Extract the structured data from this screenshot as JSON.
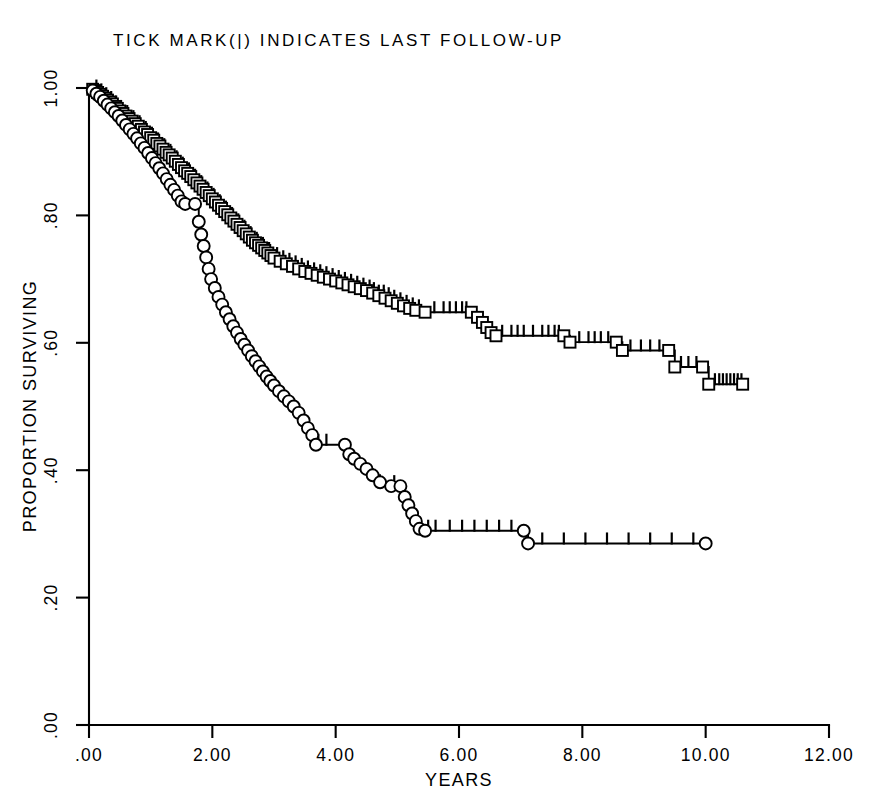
{
  "chart_data": {
    "type": "line",
    "subtype": "kaplan-meier-survival",
    "title": "TICK MARK(|) INDICATES LAST FOLLOW-UP",
    "xlabel": "YEARS",
    "ylabel": "PROPORTION SURVIVING",
    "xlim": [
      0,
      12
    ],
    "ylim": [
      0,
      1
    ],
    "grid": false,
    "legend": "none",
    "x_ticks": [
      0,
      2,
      4,
      6,
      8,
      10,
      12
    ],
    "x_tick_labels": [
      ".00",
      "2.00",
      "4.00",
      "6.00",
      "8.00",
      "10.00",
      "12.00"
    ],
    "y_ticks": [
      0,
      0.2,
      0.4,
      0.6,
      0.8,
      1.0
    ],
    "y_tick_labels": [
      ".00",
      ".20",
      ".40",
      ".60",
      ".80",
      "1.00"
    ],
    "annotation": "Tick marks on the step curves denote censored observations (last follow-up).",
    "series": [
      {
        "name": "upper-curve",
        "marker": "open-square",
        "marker_count_note": "markers plotted at every event (death) step",
        "x_end": 10.6,
        "y_end": 0.535,
        "points": [
          [
            0.0,
            1.0
          ],
          [
            0.06,
            0.998
          ],
          [
            0.1,
            0.996
          ],
          [
            0.14,
            0.993
          ],
          [
            0.18,
            0.99
          ],
          [
            0.22,
            0.987
          ],
          [
            0.26,
            0.984
          ],
          [
            0.3,
            0.981
          ],
          [
            0.34,
            0.978
          ],
          [
            0.38,
            0.975
          ],
          [
            0.42,
            0.971
          ],
          [
            0.46,
            0.968
          ],
          [
            0.5,
            0.964
          ],
          [
            0.55,
            0.96
          ],
          [
            0.6,
            0.956
          ],
          [
            0.65,
            0.952
          ],
          [
            0.7,
            0.948
          ],
          [
            0.75,
            0.944
          ],
          [
            0.8,
            0.94
          ],
          [
            0.85,
            0.935
          ],
          [
            0.9,
            0.931
          ],
          [
            0.95,
            0.927
          ],
          [
            1.0,
            0.922
          ],
          [
            1.05,
            0.918
          ],
          [
            1.1,
            0.913
          ],
          [
            1.15,
            0.909
          ],
          [
            1.2,
            0.904
          ],
          [
            1.25,
            0.899
          ],
          [
            1.3,
            0.895
          ],
          [
            1.35,
            0.89
          ],
          [
            1.4,
            0.885
          ],
          [
            1.45,
            0.88
          ],
          [
            1.5,
            0.875
          ],
          [
            1.55,
            0.87
          ],
          [
            1.6,
            0.866
          ],
          [
            1.65,
            0.861
          ],
          [
            1.7,
            0.856
          ],
          [
            1.75,
            0.851
          ],
          [
            1.8,
            0.846
          ],
          [
            1.85,
            0.841
          ],
          [
            1.9,
            0.836
          ],
          [
            1.95,
            0.831
          ],
          [
            2.0,
            0.826
          ],
          [
            2.05,
            0.821
          ],
          [
            2.1,
            0.816
          ],
          [
            2.15,
            0.811
          ],
          [
            2.2,
            0.806
          ],
          [
            2.25,
            0.801
          ],
          [
            2.3,
            0.796
          ],
          [
            2.35,
            0.791
          ],
          [
            2.4,
            0.786
          ],
          [
            2.45,
            0.781
          ],
          [
            2.5,
            0.776
          ],
          [
            2.55,
            0.771
          ],
          [
            2.6,
            0.766
          ],
          [
            2.65,
            0.761
          ],
          [
            2.7,
            0.757
          ],
          [
            2.75,
            0.753
          ],
          [
            2.8,
            0.749
          ],
          [
            2.85,
            0.745
          ],
          [
            2.9,
            0.741
          ],
          [
            2.95,
            0.737
          ],
          [
            3.0,
            0.733
          ],
          [
            3.1,
            0.728
          ],
          [
            3.2,
            0.724
          ],
          [
            3.3,
            0.72
          ],
          [
            3.4,
            0.716
          ],
          [
            3.5,
            0.712
          ],
          [
            3.6,
            0.709
          ],
          [
            3.7,
            0.706
          ],
          [
            3.8,
            0.703
          ],
          [
            3.9,
            0.7
          ],
          [
            4.0,
            0.697
          ],
          [
            4.1,
            0.694
          ],
          [
            4.2,
            0.691
          ],
          [
            4.3,
            0.688
          ],
          [
            4.4,
            0.685
          ],
          [
            4.5,
            0.682
          ],
          [
            4.6,
            0.678
          ],
          [
            4.7,
            0.674
          ],
          [
            4.8,
            0.67
          ],
          [
            4.9,
            0.666
          ],
          [
            5.0,
            0.662
          ],
          [
            5.1,
            0.658
          ],
          [
            5.2,
            0.654
          ],
          [
            5.3,
            0.651
          ],
          [
            5.45,
            0.648
          ],
          [
            6.2,
            0.648
          ],
          [
            6.3,
            0.64
          ],
          [
            6.38,
            0.632
          ],
          [
            6.45,
            0.624
          ],
          [
            6.52,
            0.616
          ],
          [
            6.6,
            0.611
          ],
          [
            7.7,
            0.611
          ],
          [
            7.8,
            0.601
          ],
          [
            8.55,
            0.601
          ],
          [
            8.65,
            0.588
          ],
          [
            9.4,
            0.588
          ],
          [
            9.5,
            0.562
          ],
          [
            9.95,
            0.562
          ],
          [
            10.05,
            0.535
          ],
          [
            10.6,
            0.535
          ]
        ],
        "censored_x": [
          0.12,
          0.2,
          0.28,
          0.36,
          0.44,
          0.52,
          0.62,
          0.72,
          0.82,
          0.92,
          1.02,
          1.12,
          1.22,
          1.32,
          1.42,
          1.52,
          1.62,
          1.72,
          1.82,
          1.92,
          2.02,
          2.12,
          2.22,
          2.32,
          2.42,
          2.52,
          2.62,
          2.72,
          2.82,
          2.92,
          3.05,
          3.15,
          3.25,
          3.35,
          3.45,
          3.55,
          3.65,
          3.75,
          3.85,
          3.95,
          4.05,
          4.15,
          4.25,
          4.35,
          4.45,
          4.55,
          4.62,
          4.7,
          4.78,
          4.86,
          4.95,
          5.05,
          5.15,
          5.25,
          5.35,
          5.6,
          5.75,
          5.85,
          5.95,
          6.05,
          6.12,
          6.7,
          6.85,
          6.95,
          7.05,
          7.2,
          7.35,
          7.45,
          7.55,
          7.62,
          7.95,
          8.1,
          8.2,
          8.3,
          8.42,
          8.78,
          8.95,
          9.1,
          9.25,
          9.6,
          9.72,
          9.85,
          10.15,
          10.22,
          10.28,
          10.34,
          10.4,
          10.46,
          10.52,
          10.58
        ]
      },
      {
        "name": "lower-curve",
        "marker": "open-circle",
        "marker_count_note": "markers plotted at every event (death) step",
        "x_end": 10.0,
        "y_end": 0.285,
        "points": [
          [
            0.0,
            1.0
          ],
          [
            0.06,
            0.996
          ],
          [
            0.12,
            0.991
          ],
          [
            0.18,
            0.986
          ],
          [
            0.24,
            0.98
          ],
          [
            0.3,
            0.974
          ],
          [
            0.36,
            0.968
          ],
          [
            0.42,
            0.962
          ],
          [
            0.48,
            0.956
          ],
          [
            0.54,
            0.949
          ],
          [
            0.6,
            0.942
          ],
          [
            0.66,
            0.935
          ],
          [
            0.72,
            0.928
          ],
          [
            0.78,
            0.921
          ],
          [
            0.84,
            0.913
          ],
          [
            0.9,
            0.906
          ],
          [
            0.96,
            0.898
          ],
          [
            1.02,
            0.89
          ],
          [
            1.08,
            0.882
          ],
          [
            1.14,
            0.874
          ],
          [
            1.2,
            0.866
          ],
          [
            1.26,
            0.857
          ],
          [
            1.32,
            0.848
          ],
          [
            1.38,
            0.84
          ],
          [
            1.44,
            0.831
          ],
          [
            1.5,
            0.822
          ],
          [
            1.56,
            0.818
          ],
          [
            1.72,
            0.818
          ],
          [
            1.78,
            0.79
          ],
          [
            1.82,
            0.77
          ],
          [
            1.86,
            0.752
          ],
          [
            1.9,
            0.734
          ],
          [
            1.94,
            0.716
          ],
          [
            1.98,
            0.7
          ],
          [
            2.04,
            0.686
          ],
          [
            2.1,
            0.672
          ],
          [
            2.16,
            0.66
          ],
          [
            2.22,
            0.648
          ],
          [
            2.28,
            0.637
          ],
          [
            2.34,
            0.626
          ],
          [
            2.4,
            0.616
          ],
          [
            2.46,
            0.606
          ],
          [
            2.52,
            0.597
          ],
          [
            2.58,
            0.588
          ],
          [
            2.64,
            0.579
          ],
          [
            2.7,
            0.571
          ],
          [
            2.76,
            0.563
          ],
          [
            2.82,
            0.555
          ],
          [
            2.88,
            0.547
          ],
          [
            2.94,
            0.54
          ],
          [
            3.0,
            0.533
          ],
          [
            3.08,
            0.524
          ],
          [
            3.16,
            0.516
          ],
          [
            3.24,
            0.508
          ],
          [
            3.32,
            0.5
          ],
          [
            3.4,
            0.49
          ],
          [
            3.48,
            0.478
          ],
          [
            3.55,
            0.466
          ],
          [
            3.62,
            0.455
          ],
          [
            3.68,
            0.44
          ],
          [
            4.15,
            0.44
          ],
          [
            4.22,
            0.425
          ],
          [
            4.3,
            0.418
          ],
          [
            4.4,
            0.41
          ],
          [
            4.5,
            0.402
          ],
          [
            4.6,
            0.392
          ],
          [
            4.72,
            0.381
          ],
          [
            4.9,
            0.375
          ],
          [
            5.05,
            0.375
          ],
          [
            5.12,
            0.358
          ],
          [
            5.18,
            0.345
          ],
          [
            5.24,
            0.332
          ],
          [
            5.3,
            0.32
          ],
          [
            5.36,
            0.308
          ],
          [
            5.45,
            0.305
          ],
          [
            7.05,
            0.305
          ],
          [
            7.12,
            0.285
          ],
          [
            10.0,
            0.285
          ]
        ],
        "censored_x": [
          3.72,
          3.85,
          4.95,
          5.5,
          5.62,
          5.85,
          6.05,
          6.25,
          6.45,
          6.65,
          6.85,
          7.35,
          7.7,
          8.05,
          8.4,
          8.75,
          9.1,
          9.45,
          9.8
        ]
      }
    ]
  },
  "axes": {
    "y_title": "PROPORTION SURVIVING",
    "x_title": "YEARS"
  },
  "title": {
    "text": "TICK MARK(|) INDICATES LAST FOLLOW-UP"
  },
  "style": {
    "ink": "#000000",
    "paper": "#ffffff"
  }
}
